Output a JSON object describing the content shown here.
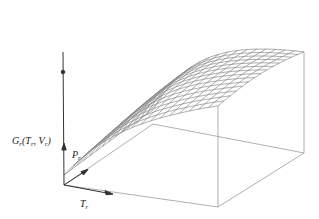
{
  "figure": {
    "type": "3d-surface-mesh",
    "labels": {
      "z_axis": {
        "main": "G",
        "sub": "r",
        "args": "(T",
        "arg1_sub": "r",
        "sep": ", V",
        "arg2_sub": "r",
        "close": ")"
      },
      "p_axis": {
        "main": "P",
        "sub": "r"
      },
      "t_axis": {
        "main": "T",
        "sub": "r"
      }
    },
    "colors": {
      "axis": "#333333",
      "mesh": "#8a8a8a",
      "box": "#9a9a9a",
      "background": "#ffffff"
    },
    "mesh": {
      "rows": 14,
      "cols": 16
    },
    "geometry": {
      "origin": [
        64,
        185
      ],
      "z_axis_top": [
        63,
        52
      ],
      "marker": [
        63,
        72
      ],
      "base_back": [
        153,
        124
      ],
      "base_right": [
        304,
        153
      ],
      "base_front": [
        218,
        207
      ],
      "t_axis_end": [
        112,
        194
      ],
      "p_axis_end": [
        87,
        170
      ]
    }
  }
}
